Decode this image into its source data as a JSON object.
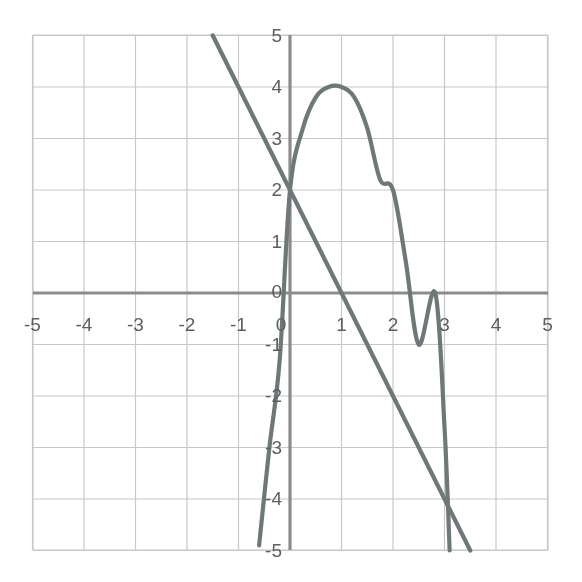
{
  "chart_data": {
    "type": "line",
    "title": "",
    "subtitle": "",
    "xlabel": "",
    "ylabel": "",
    "xlim": [
      -5,
      5
    ],
    "ylim": [
      -5,
      5
    ],
    "grid": true,
    "grid_step": 1,
    "legend_position": "none",
    "x_tick_labels": [
      "-5",
      "-4",
      "-3",
      "-2",
      "-1",
      "0",
      "1",
      "2",
      "3",
      "4",
      "5"
    ],
    "y_tick_labels": [
      "5",
      "4",
      "3",
      "2",
      "1",
      "0",
      "-1",
      "-2",
      "-3",
      "-4",
      "-5"
    ],
    "x_ticks": [
      -5,
      -4,
      -3,
      -2,
      -1,
      0,
      1,
      2,
      3,
      4,
      5
    ],
    "y_ticks": [
      5,
      4,
      3,
      2,
      1,
      0,
      -1,
      -2,
      -3,
      -4,
      -5
    ],
    "annotations": [],
    "series": [
      {
        "name": "line",
        "kind": "line",
        "equation": "y = -2x + 2",
        "slope": -2,
        "y_intercept": 2,
        "x_intercept": 1,
        "color": "#6f7878",
        "stroke_width": 4.2,
        "x": [
          -1.5,
          -1,
          0,
          1,
          2,
          3,
          3.5
        ],
        "values": [
          5,
          4,
          2,
          0,
          -2,
          -4,
          -5
        ],
        "key_points": [
          {
            "x": 0,
            "y": 2,
            "note": "y-intercept, intersection with parabola"
          },
          {
            "x": 1,
            "y": 0,
            "note": "x-intercept"
          },
          {
            "x": 3.5,
            "y": -5,
            "note": "exits bottom of grid"
          },
          {
            "x": -1.5,
            "y": 5,
            "note": "exits top of grid"
          }
        ]
      },
      {
        "name": "parabola",
        "kind": "curve",
        "equation": "y = -2(x - 1)^2 + 4",
        "leading_coefficient": -2,
        "vertex": [
          1,
          4
        ],
        "opens": "down",
        "y_intercept": 2,
        "x_intercepts": [
          -0.12,
          2.82
        ],
        "color": "#6f7878",
        "stroke_width": 4.2,
        "x": [
          -0.6,
          -0.4,
          -0.2,
          0,
          0.25,
          0.5,
          0.75,
          1,
          1.25,
          1.5,
          1.75,
          2,
          2.25,
          2.5,
          2.82,
          3,
          3.1
        ],
        "values": [
          -4.9,
          -3.0,
          -1.3,
          2,
          3.2,
          3.8,
          4.0,
          4,
          3.8,
          3.2,
          2.2,
          2,
          0.6,
          -1.0,
          0,
          -2.6,
          -5
        ]
      }
    ],
    "intersections": [
      {
        "x": 0,
        "y": 2,
        "between": [
          "line",
          "parabola"
        ]
      },
      {
        "x": 3,
        "y": -4,
        "between": [
          "line",
          "parabola"
        ],
        "approximate": true
      }
    ]
  },
  "style": {
    "background": "#ffffff",
    "grid_color": "#c8c8c8",
    "grid_minor_color": "#d6d6d6",
    "axis_color": "#8c8c8c",
    "curve_color": "#6f7878",
    "label_color": "#5e5e5e",
    "plot_left_px": 33,
    "plot_right_px": 548,
    "plot_top_px": 35,
    "plot_bottom_px": 550,
    "origin_x_px": 290,
    "origin_y_px": 293,
    "unit_px": 51.5
  }
}
